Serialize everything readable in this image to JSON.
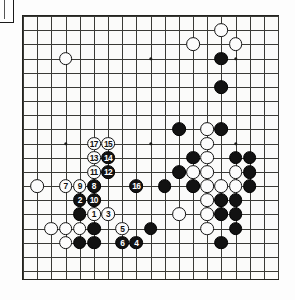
{
  "diagram": {
    "type": "go-board-diagram",
    "board_size": 19,
    "title": "",
    "caption": "",
    "colors": {
      "black_stone": "#121212",
      "white_stone": "#fcfcfc",
      "grid_line": "#3a3a36",
      "board_border": "#23231f",
      "board_background": "#fbfbfa"
    },
    "geometry": {
      "origin_x": 22,
      "origin_y": 15,
      "spacing": 14.17,
      "lines": 19
    },
    "hoshi": [
      {
        "col": 3,
        "row": 3
      },
      {
        "col": 9,
        "row": 3
      },
      {
        "col": 15,
        "row": 3
      },
      {
        "col": 3,
        "row": 9
      },
      {
        "col": 9,
        "row": 9
      },
      {
        "col": 15,
        "row": 9
      },
      {
        "col": 3,
        "row": 15
      },
      {
        "col": 9,
        "row": 15
      },
      {
        "col": 15,
        "row": 15
      }
    ],
    "stones": [
      {
        "col": 3,
        "row": 3,
        "color": "white",
        "label": ""
      },
      {
        "col": 14,
        "row": 1,
        "color": "white",
        "label": ""
      },
      {
        "col": 12,
        "row": 2,
        "color": "white",
        "label": ""
      },
      {
        "col": 15,
        "row": 2,
        "color": "white",
        "label": ""
      },
      {
        "col": 14,
        "row": 3,
        "color": "black",
        "label": ""
      },
      {
        "col": 14,
        "row": 5,
        "color": "black",
        "label": ""
      },
      {
        "col": 11,
        "row": 8,
        "color": "black",
        "label": ""
      },
      {
        "col": 13,
        "row": 8,
        "color": "white",
        "label": ""
      },
      {
        "col": 14,
        "row": 8,
        "color": "black",
        "label": ""
      },
      {
        "col": 13,
        "row": 9,
        "color": "white",
        "label": ""
      },
      {
        "col": 12,
        "row": 10,
        "color": "black",
        "label": ""
      },
      {
        "col": 13,
        "row": 10,
        "color": "white",
        "label": ""
      },
      {
        "col": 15,
        "row": 10,
        "color": "black",
        "label": ""
      },
      {
        "col": 16,
        "row": 10,
        "color": "black",
        "label": ""
      },
      {
        "col": 11,
        "row": 11,
        "color": "black",
        "label": ""
      },
      {
        "col": 12,
        "row": 11,
        "color": "white",
        "label": ""
      },
      {
        "col": 13,
        "row": 11,
        "color": "white",
        "label": ""
      },
      {
        "col": 15,
        "row": 11,
        "color": "white",
        "label": ""
      },
      {
        "col": 16,
        "row": 11,
        "color": "black",
        "label": ""
      },
      {
        "col": 10,
        "row": 12,
        "color": "black",
        "label": ""
      },
      {
        "col": 12,
        "row": 12,
        "color": "black",
        "label": ""
      },
      {
        "col": 13,
        "row": 12,
        "color": "white",
        "label": ""
      },
      {
        "col": 14,
        "row": 12,
        "color": "white",
        "label": ""
      },
      {
        "col": 15,
        "row": 12,
        "color": "white",
        "label": ""
      },
      {
        "col": 16,
        "row": 12,
        "color": "black",
        "label": ""
      },
      {
        "col": 13,
        "row": 13,
        "color": "white",
        "label": ""
      },
      {
        "col": 14,
        "row": 13,
        "color": "black",
        "label": ""
      },
      {
        "col": 15,
        "row": 13,
        "color": "black",
        "label": ""
      },
      {
        "col": 11,
        "row": 14,
        "color": "white",
        "label": ""
      },
      {
        "col": 13,
        "row": 14,
        "color": "white",
        "label": ""
      },
      {
        "col": 14,
        "row": 14,
        "color": "black",
        "label": ""
      },
      {
        "col": 15,
        "row": 14,
        "color": "black",
        "label": ""
      },
      {
        "col": 9,
        "row": 15,
        "color": "black",
        "label": ""
      },
      {
        "col": 13,
        "row": 15,
        "color": "white",
        "label": ""
      },
      {
        "col": 15,
        "row": 15,
        "color": "black",
        "label": ""
      },
      {
        "col": 14,
        "row": 16,
        "color": "black",
        "label": ""
      },
      {
        "col": 1,
        "row": 12,
        "color": "white",
        "label": ""
      },
      {
        "col": 2,
        "row": 15,
        "color": "white",
        "label": ""
      },
      {
        "col": 3,
        "row": 15,
        "color": "white",
        "label": ""
      },
      {
        "col": 4,
        "row": 15,
        "color": "white",
        "label": ""
      },
      {
        "col": 5,
        "row": 15,
        "color": "black",
        "label": ""
      },
      {
        "col": 3,
        "row": 16,
        "color": "white",
        "label": ""
      },
      {
        "col": 4,
        "row": 16,
        "color": "black",
        "label": ""
      },
      {
        "col": 5,
        "row": 16,
        "color": "black",
        "label": ""
      },
      {
        "col": 4,
        "row": 14,
        "color": "black",
        "label": ""
      },
      {
        "col": 5,
        "row": 14,
        "color": "white",
        "label": "1"
      },
      {
        "col": 4,
        "row": 13,
        "color": "black",
        "label": "2"
      },
      {
        "col": 6,
        "row": 14,
        "color": "white",
        "label": "3"
      },
      {
        "col": 8,
        "row": 16,
        "color": "black",
        "label": "4"
      },
      {
        "col": 7,
        "row": 15,
        "color": "white",
        "label": "5"
      },
      {
        "col": 7,
        "row": 16,
        "color": "black",
        "label": "6"
      },
      {
        "col": 3,
        "row": 12,
        "color": "white",
        "label": "7"
      },
      {
        "col": 5,
        "row": 12,
        "color": "black",
        "label": "8"
      },
      {
        "col": 4,
        "row": 12,
        "color": "white",
        "label": "9"
      },
      {
        "col": 5,
        "row": 13,
        "color": "black",
        "label": "10"
      },
      {
        "col": 5,
        "row": 11,
        "color": "white",
        "label": "11"
      },
      {
        "col": 6,
        "row": 11,
        "color": "black",
        "label": "12"
      },
      {
        "col": 5,
        "row": 10,
        "color": "white",
        "label": "13"
      },
      {
        "col": 6,
        "row": 10,
        "color": "black",
        "label": "14"
      },
      {
        "col": 6,
        "row": 9,
        "color": "white",
        "label": "15"
      },
      {
        "col": 8,
        "row": 12,
        "color": "black",
        "label": "16"
      },
      {
        "col": 5,
        "row": 9,
        "color": "white",
        "label": "17"
      }
    ]
  }
}
